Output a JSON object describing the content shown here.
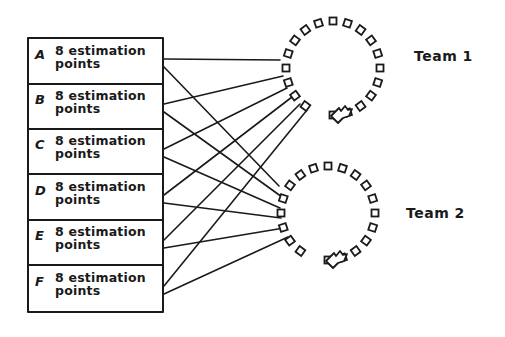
{
  "diagram": {
    "type": "story-to-team allocation sketch",
    "stories": [
      {
        "id": "A",
        "text": "8 estimation points"
      },
      {
        "id": "B",
        "text": "8 estimation points"
      },
      {
        "id": "C",
        "text": "8 estimation points"
      },
      {
        "id": "D",
        "text": "8 estimation points"
      },
      {
        "id": "E",
        "text": "8 estimation points"
      },
      {
        "id": "F",
        "text": "8 estimation points"
      }
    ],
    "teams": [
      {
        "label": "Team 1",
        "cx": 333,
        "cy": 68,
        "r": 47
      },
      {
        "label": "Team 2",
        "cx": 328,
        "cy": 213,
        "r": 47
      }
    ],
    "connections": [
      {
        "from": "A",
        "to": "Team 1"
      },
      {
        "from": "A",
        "to": "Team 2"
      },
      {
        "from": "B",
        "to": "Team 1"
      },
      {
        "from": "B",
        "to": "Team 2"
      },
      {
        "from": "C",
        "to": "Team 1"
      },
      {
        "from": "C",
        "to": "Team 2"
      },
      {
        "from": "D",
        "to": "Team 1"
      },
      {
        "from": "D",
        "to": "Team 2"
      },
      {
        "from": "E",
        "to": "Team 1"
      },
      {
        "from": "E",
        "to": "Team 2"
      },
      {
        "from": "F",
        "to": "Team 1"
      },
      {
        "from": "F",
        "to": "Team 2"
      }
    ],
    "colors": {
      "ink": "#1a1a1a",
      "background": "#ffffff"
    }
  }
}
